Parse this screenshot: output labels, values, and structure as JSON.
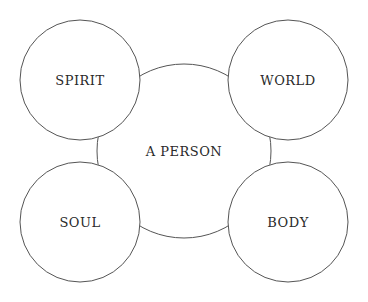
{
  "diagram": {
    "center": {
      "label": "A PERSON",
      "cx": 184,
      "cy": 151,
      "r": 87
    },
    "nodes": [
      {
        "id": "spirit",
        "label": "SPIRIT",
        "cx": 80,
        "cy": 80,
        "r": 60
      },
      {
        "id": "world",
        "label": "WORLD",
        "cx": 288,
        "cy": 80,
        "r": 60
      },
      {
        "id": "soul",
        "label": "SOUL",
        "cx": 80,
        "cy": 222,
        "r": 60
      },
      {
        "id": "body",
        "label": "BODY",
        "cx": 288,
        "cy": 222,
        "r": 60
      }
    ],
    "stroke_color": "#555555"
  }
}
